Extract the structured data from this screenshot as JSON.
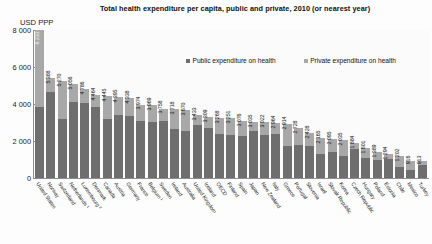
{
  "chart_data": {
    "type": "bar",
    "subtype": "stacked-bar",
    "title": "Total health expenditure per capita, public and private, 2010 (or nearest year)",
    "ylabel": "USD PPP",
    "xlabel": "",
    "ylim": [
      0,
      8000
    ],
    "yticks": [
      "0",
      "2 000",
      "4 000",
      "6 000",
      "8 000"
    ],
    "ytick_values": [
      0,
      2000,
      4000,
      6000,
      8000
    ],
    "grid": false,
    "legend_position": "top-center",
    "legend": [
      {
        "name": "Public expenditure on health",
        "color": "#6e6e6e"
      },
      {
        "name": "Private expenditure on health",
        "color": "#a8a8a8"
      }
    ],
    "categories": [
      "United States",
      "Norway",
      "Switzerland",
      "Netherlands ¹",
      "Luxembourg ²",
      "Denmark",
      "Canada",
      "Austria",
      "Germany",
      "France",
      "Belgium ¹",
      "Sweden",
      "Ireland",
      "Australia",
      "United Kingdom",
      "Iceland",
      "OECD",
      "Finland",
      "Spain",
      "Japan",
      "New Zealand",
      "Italy",
      "Greece",
      "Portugal",
      "Slovenia",
      "Israel",
      "Slovak Republic",
      "Korea",
      "Czech Republic",
      "Hungary",
      "Poland",
      "Estonia",
      "Chile",
      "Mexico",
      "Turkey"
    ],
    "values": [
      8233,
      5388,
      5270,
      5056,
      4786,
      4464,
      4445,
      4395,
      4338,
      3974,
      3969,
      3758,
      3718,
      3670,
      3433,
      3309,
      3268,
      3251,
      3076,
      3035,
      3022,
      2964,
      2914,
      2728,
      2428,
      2165,
      2095,
      2035,
      1884,
      1601,
      1389,
      1294,
      1202,
      916,
      913
    ],
    "value_labels": [
      "8 233",
      "5 388",
      "5 270",
      "5 056",
      "4 786",
      "4 464",
      "4 445",
      "4 395",
      "4 338",
      "3 974",
      "3 969",
      "3 758",
      "3 718",
      "3 670",
      "3 433",
      "3 309",
      "3 268",
      "3 251",
      "3 076",
      "3 035",
      "3 022",
      "2 964",
      "2 914",
      "2 728",
      "2 428",
      "2 165",
      "2 095",
      "2 035",
      "1 884",
      "1 601",
      "1 389",
      "1 294",
      "1 202",
      "916",
      "913"
    ],
    "series": [
      {
        "name": "Public expenditure on health",
        "color": "#6e6e6e",
        "values": [
          3967,
          4634,
          3214,
          4095,
          4068,
          3828,
          3181,
          3393,
          3331,
          3061,
          3016,
          3086,
          2636,
          2523,
          2857,
          2729,
          2377,
          2346,
          2259,
          2550,
          2312,
          2356,
          1752,
          1797,
          1751,
          1283,
          1414,
          1192,
          1567,
          1063,
          978,
          1005,
          569,
          442,
          678
        ]
      },
      {
        "name": "Private expenditure on health",
        "color": "#a8a8a8",
        "values": [
          4266,
          754,
          2056,
          961,
          718,
          636,
          1264,
          1002,
          1007,
          913,
          953,
          672,
          1082,
          1147,
          576,
          580,
          891,
          905,
          817,
          485,
          710,
          608,
          1162,
          931,
          677,
          882,
          681,
          843,
          317,
          538,
          411,
          289,
          633,
          474,
          235
        ]
      }
    ]
  }
}
